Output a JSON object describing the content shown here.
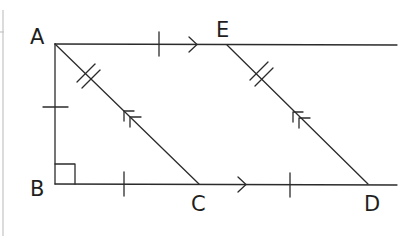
{
  "diagram": {
    "type": "geometry",
    "points": {
      "A": {
        "label": "A",
        "x": 55,
        "y": 44
      },
      "E": {
        "label": "E",
        "x": 227,
        "y": 45
      },
      "B": {
        "label": "B",
        "x": 55,
        "y": 184
      },
      "C": {
        "label": "C",
        "x": 199,
        "y": 184
      },
      "D": {
        "label": "D",
        "x": 368,
        "y": 184
      }
    },
    "labels": {
      "A": "A",
      "B": "B",
      "C": "C",
      "D": "D",
      "E": "E"
    },
    "segments": [
      {
        "from": "A",
        "to": "E",
        "marks": "single-tick, single-arrow",
        "note": "extended ray to right"
      },
      {
        "from": "A",
        "to": "B",
        "marks": "single-tick"
      },
      {
        "from": "B",
        "to": "C",
        "marks": "single-tick"
      },
      {
        "from": "C",
        "to": "D",
        "marks": "single-tick, single-arrow",
        "note": "extended to right"
      },
      {
        "from": "A",
        "to": "C",
        "marks": "double-tick, double-arrow"
      },
      {
        "from": "E",
        "to": "D",
        "marks": "double-tick, double-arrow"
      }
    ],
    "right_angle_at": "B",
    "colors": {
      "stroke": "#2b2b2b",
      "border": "#c4c4c4",
      "background": "#ffffff"
    }
  }
}
